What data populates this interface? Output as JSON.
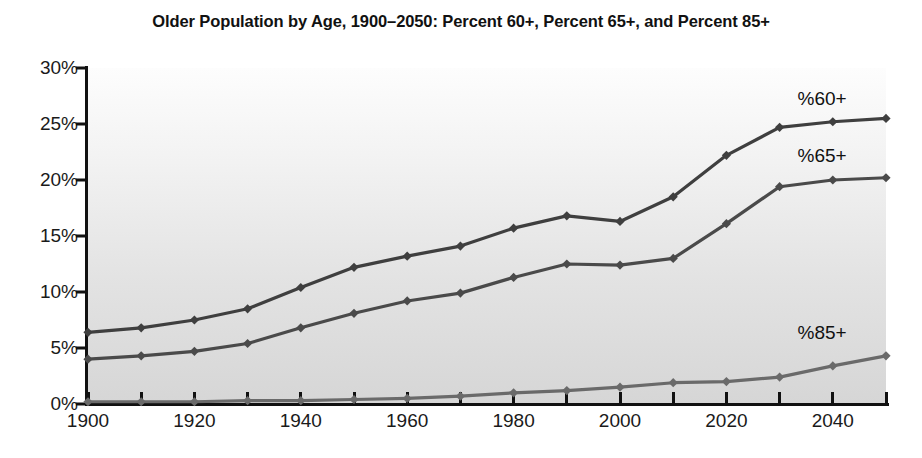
{
  "chart_data": {
    "type": "line",
    "title": "Older Population by Age, 1900–2050: Percent 60+, Percent 65+, and Percent 85+",
    "xlabel": "",
    "ylabel": "",
    "x": [
      1900,
      1910,
      1920,
      1930,
      1940,
      1950,
      1960,
      1970,
      1980,
      1990,
      2000,
      2010,
      2020,
      2030,
      2040,
      2050
    ],
    "xlim": [
      1900,
      2050
    ],
    "ylim": [
      0,
      30
    ],
    "x_tick_labels": [
      "1900",
      "1920",
      "1940",
      "1960",
      "1980",
      "2000",
      "2020",
      "2040"
    ],
    "x_tick_values": [
      1900,
      1920,
      1940,
      1960,
      1980,
      2000,
      2020,
      2040
    ],
    "x_minor_ticks": [
      1900,
      1910,
      1920,
      1930,
      1940,
      1950,
      1960,
      1970,
      1980,
      1990,
      2000,
      2010,
      2020,
      2030,
      2040,
      2050
    ],
    "y_tick_labels": [
      "0%",
      "5%",
      "10%",
      "15%",
      "20%",
      "25%",
      "30%"
    ],
    "y_tick_values": [
      0,
      5,
      10,
      15,
      20,
      25,
      30
    ],
    "grid": false,
    "legend_position": "inline-right",
    "series": [
      {
        "name": "%60+",
        "label": "%60+",
        "color": "#3f3f3f",
        "label_x": 2038,
        "label_y": 27.2,
        "values": [
          6.4,
          6.8,
          7.5,
          8.5,
          10.4,
          12.2,
          13.2,
          14.1,
          15.7,
          16.8,
          16.3,
          18.5,
          22.2,
          24.7,
          25.2,
          25.5
        ]
      },
      {
        "name": "%65+",
        "label": "%65+",
        "color": "#4a4a4a",
        "label_x": 2038,
        "label_y": 22.1,
        "values": [
          4.0,
          4.3,
          4.7,
          5.4,
          6.8,
          8.1,
          9.2,
          9.9,
          11.3,
          12.5,
          12.4,
          13.0,
          16.1,
          19.4,
          20.0,
          20.2
        ]
      },
      {
        "name": "%85+",
        "label": "%85+",
        "color": "#6a6a6a",
        "label_x": 2038,
        "label_y": 6.3,
        "values": [
          0.2,
          0.2,
          0.2,
          0.3,
          0.3,
          0.4,
          0.5,
          0.7,
          1.0,
          1.2,
          1.5,
          1.9,
          2.0,
          2.4,
          3.4,
          4.3
        ]
      }
    ]
  }
}
